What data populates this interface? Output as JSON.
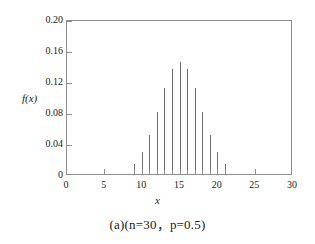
{
  "chart_data": {
    "type": "bar",
    "title": "",
    "subtitle": "",
    "caption": "(a)(n=30，p=0.5)",
    "xlabel": "x",
    "ylabel": "f(x)",
    "xlim": [
      0,
      30
    ],
    "ylim": [
      0,
      0.2
    ],
    "grid": false,
    "legend": null,
    "xticks": [
      "0",
      "5",
      "10",
      "15",
      "20",
      "25",
      "30"
    ],
    "xtick_values": [
      0,
      5,
      10,
      15,
      20,
      25,
      30
    ],
    "yticks": [
      "0",
      "0.04",
      "0.08",
      "0.12",
      "0.16",
      "0.20"
    ],
    "ytick_values": [
      0,
      0.04,
      0.08,
      0.12,
      0.16,
      0.2
    ],
    "x": [
      9,
      10,
      11,
      12,
      13,
      14,
      15,
      16,
      17,
      18,
      19,
      20,
      21
    ],
    "values": [
      0.0133,
      0.028,
      0.0509,
      0.0806,
      0.1115,
      0.1354,
      0.1445,
      0.1354,
      0.1115,
      0.0806,
      0.0509,
      0.028,
      0.0133
    ],
    "series": [
      {
        "name": "f(x)",
        "values": [
          0.0133,
          0.028,
          0.0509,
          0.0806,
          0.1115,
          0.1354,
          0.1445,
          0.1354,
          0.1115,
          0.0806,
          0.0509,
          0.028,
          0.0133
        ]
      }
    ],
    "bar_color": "#6e6e6e",
    "frame_color": "#8d8d8d"
  },
  "figure": {
    "y_axis_title": "f(x)",
    "x_axis_title": "x",
    "caption": "(a)(n=30，p=0.5)"
  }
}
